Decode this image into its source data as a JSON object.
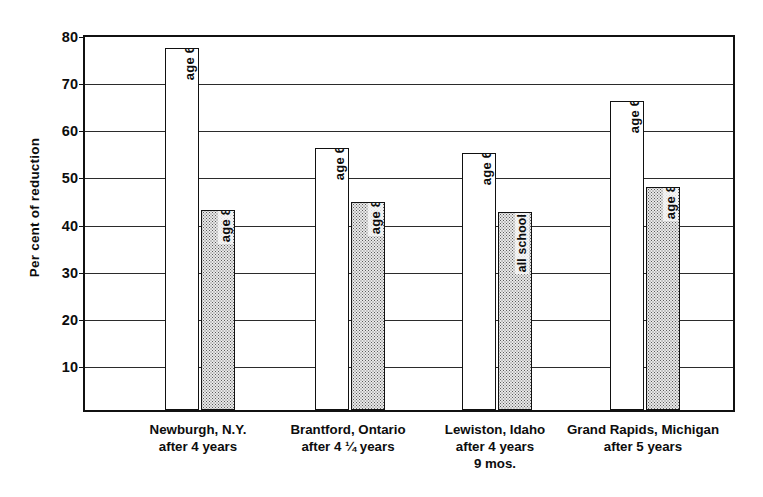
{
  "chart_data": {
    "type": "bar",
    "title": "",
    "subtitle": "",
    "xlabel": "",
    "ylabel": "Per cent of reduction",
    "ylim": [
      0,
      80
    ],
    "yticks": [
      10,
      20,
      30,
      40,
      50,
      60,
      70,
      80
    ],
    "ytick_labels": [
      "10",
      "20",
      "30",
      "40",
      "50",
      "60",
      "70",
      "80"
    ],
    "grid": true,
    "legend_position": "none",
    "categories": [
      "Newburgh, N.Y. after 4 years",
      "Brantford, Ontario after 4 1/4 years",
      "Lewiston, Idaho after 4 years 9 mos.",
      "Grand Rapids, Michigan after 5 years"
    ],
    "category_labels": [
      [
        "Newburgh, N.Y.",
        "after 4 years"
      ],
      [
        "Brantford, Ontario",
        "after 4 ¼ years"
      ],
      [
        "Lewiston, Idaho",
        "after 4 years",
        "9 mos."
      ],
      [
        "Grand Rapids, Michigan",
        "after 5 years"
      ]
    ],
    "series": [
      {
        "name": "age 6",
        "style": "white",
        "values": [
          76.8,
          55.5,
          54.5,
          65.6
        ]
      },
      {
        "name": "age 8 / all school ages",
        "style": "stippled",
        "values": [
          42.5,
          44.1,
          42.1,
          47.3
        ]
      }
    ],
    "bars": [
      {
        "group": 0,
        "label": "age 6",
        "value": 76.8,
        "style": "white"
      },
      {
        "group": 0,
        "label": "age 8",
        "value": 42.5,
        "style": "stippled"
      },
      {
        "group": 1,
        "label": "age 6",
        "value": 55.5,
        "style": "white"
      },
      {
        "group": 1,
        "label": "age 8",
        "value": 44.1,
        "style": "stippled"
      },
      {
        "group": 2,
        "label": "age 6",
        "value": 54.5,
        "style": "white"
      },
      {
        "group": 2,
        "label": "all school ages",
        "value": 42.1,
        "style": "stippled"
      },
      {
        "group": 3,
        "label": "age 6",
        "value": 65.6,
        "style": "white"
      },
      {
        "group": 3,
        "label": "age 8",
        "value": 47.3,
        "style": "stippled"
      }
    ]
  },
  "colors": {
    "axis": "#111111",
    "grid": "#2b2b2b",
    "bar_white_fill": "#ffffff",
    "bar_stipple_fill": "#e9e9e9",
    "bar_stipple_dot": "#5a5a5a",
    "text": "#0d0d0d",
    "background": "#ffffff"
  }
}
